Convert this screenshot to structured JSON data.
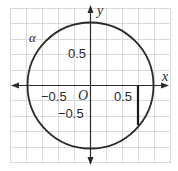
{
  "diagram": {
    "type": "unit-circle",
    "axes": {
      "x_label": "x",
      "y_label": "y",
      "origin_label": "O"
    },
    "tick_labels": {
      "x_neg": "−0.5",
      "x_pos": "0.5",
      "y_pos": "0.5",
      "y_neg": "−0.5"
    },
    "angle_label": "α",
    "circle": {
      "center": [
        0,
        0
      ],
      "radius": 1
    },
    "segment": {
      "x": 0.75,
      "y_from": 0,
      "y_to": -0.66
    },
    "grid": {
      "step": 0.25,
      "xmin": -1.25,
      "xmax": 1.25,
      "ymin": -1.25,
      "ymax": 1.25
    },
    "colors": {
      "grid": "#d8d8d8",
      "stroke": "#2a2a2a",
      "background": "#ffffff"
    }
  }
}
